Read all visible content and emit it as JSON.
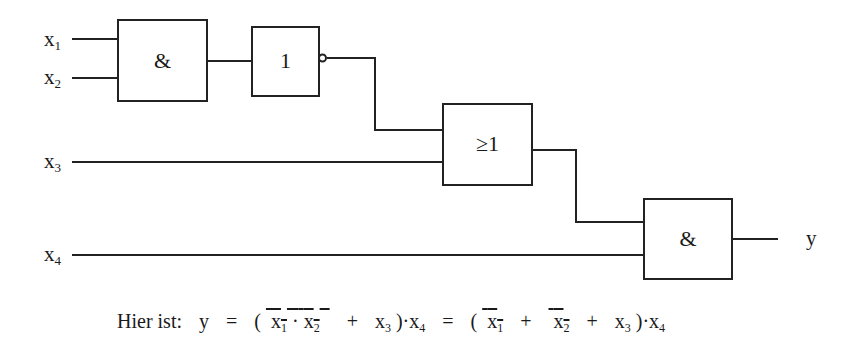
{
  "diagram": {
    "type": "logic-circuit",
    "inputs": [
      {
        "name": "x",
        "sub": "1"
      },
      {
        "name": "x",
        "sub": "2"
      },
      {
        "name": "x",
        "sub": "3"
      },
      {
        "name": "x",
        "sub": "4"
      }
    ],
    "output": {
      "name": "y"
    },
    "gates": [
      {
        "id": "and1",
        "symbol": "&",
        "inputs": [
          "x1",
          "x2"
        ]
      },
      {
        "id": "not1",
        "symbol": "1",
        "negated_output": true,
        "inputs": [
          "and1"
        ]
      },
      {
        "id": "or1",
        "symbol": "≥1",
        "inputs": [
          "not1",
          "x3"
        ]
      },
      {
        "id": "and2",
        "symbol": "&",
        "inputs": [
          "or1",
          "x4"
        ]
      }
    ]
  },
  "formula": {
    "prefix": "Hier ist:",
    "lhs": "y",
    "eq": "=",
    "open": "(",
    "close": ")",
    "dot": "·",
    "plus": "+",
    "x": "x",
    "s1": "1",
    "s2": "2",
    "s3": "3",
    "s4": "4"
  }
}
